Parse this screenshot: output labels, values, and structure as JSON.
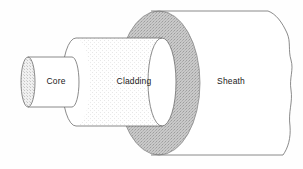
{
  "diagram": {
    "background_color": "#fefefe",
    "stroke_color": "#6d6d6d",
    "label_color": "#1a1a1a",
    "layers": [
      {
        "id": "core",
        "label": "Core",
        "label_x": 56,
        "label_y": 81,
        "fill_color": "#ffffff",
        "cap_fill_color": "#ececec",
        "texture": "fine-stipple",
        "body_left_x": 21,
        "body_right_x": 72,
        "cap_rx": 7,
        "cap_ry": 25,
        "center_y": 82
      },
      {
        "id": "cladding",
        "label": "Cladding",
        "label_x": 134,
        "label_y": 81,
        "fill_color": "#fdfdfd",
        "cap_fill_color": "#ffffff",
        "texture": "light-dotted",
        "body_left_x": 62,
        "body_right_x": 176,
        "cap_rx": 14,
        "cap_ry": 44,
        "center_y": 82
      },
      {
        "id": "sheath",
        "label": "Sheath",
        "label_x": 231,
        "label_y": 81,
        "fill_color": "#ffffff",
        "cap_fill_color": "#c9c9c9",
        "texture": "coarse-stipple",
        "body_left_x": 160,
        "body_right_x": 295,
        "cap_rx": 41,
        "cap_ry": 72,
        "center_y": 83,
        "right_edge_style": "torn-wavy"
      }
    ]
  }
}
